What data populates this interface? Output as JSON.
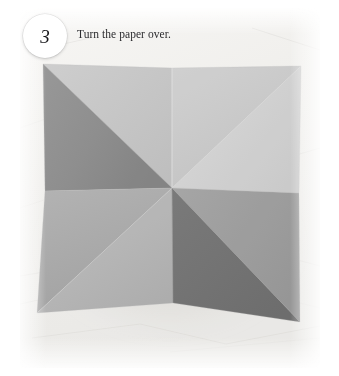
{
  "step": {
    "number": "3",
    "caption": "Turn the paper over."
  },
  "photo": {
    "alt_name": "origami-four-point-star-fold",
    "background_color": "#f1f0ee",
    "surface_description": "white textured paper surface",
    "facets": [
      {
        "name": "top-left-facet",
        "color": "#c4c4c4"
      },
      {
        "name": "left-facet",
        "color": "#8a8a8a"
      },
      {
        "name": "top-right-facet",
        "color": "#c9c9c9"
      },
      {
        "name": "right-facet",
        "color": "#d2d2d2"
      },
      {
        "name": "bottom-left-facet",
        "color": "#a8a8a8"
      },
      {
        "name": "bottom-mid-facet",
        "color": "#b4b4b4"
      },
      {
        "name": "bottom-right-facet",
        "color": "#6e6e6e"
      },
      {
        "name": "lower-right-facet",
        "color": "#9a9a9a"
      }
    ],
    "center_point": {
      "x": 172,
      "y": 188
    },
    "corners": {
      "top_left": {
        "x": 43,
        "y": 64
      },
      "top_center": {
        "x": 172,
        "y": 68
      },
      "top_right": {
        "x": 301,
        "y": 66
      },
      "left_notch": {
        "x": 45,
        "y": 191
      },
      "right_notch": {
        "x": 299,
        "y": 193
      },
      "bottom_left": {
        "x": 37,
        "y": 313
      },
      "bottom_center": {
        "x": 173,
        "y": 303
      },
      "bottom_right": {
        "x": 300,
        "y": 322
      }
    }
  },
  "colors": {
    "page_background": "#ffffff",
    "badge_background": "#ffffff",
    "badge_text": "#17171a",
    "caption_text": "#2b2b2e"
  }
}
